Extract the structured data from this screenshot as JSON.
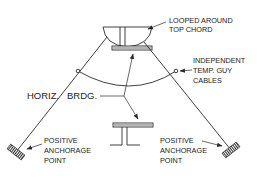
{
  "diagram": {
    "type": "structural-rigging-illustration",
    "colors": {
      "line": "#2a2a2a",
      "text": "#222222",
      "background": "#ffffff"
    },
    "labels": {
      "top_chord_l1": "LOOPED AROUND",
      "top_chord_l2": "TOP CHORD",
      "guy_l1": "INDEPENDENT",
      "guy_l2": "TEMP. GUY",
      "guy_l3": "CABLES",
      "horiz": "HORIZ.",
      "brdg": "BRDG.",
      "anchor_left_l1": "POSITIVE",
      "anchor_left_l2": "ANCHORAGE",
      "anchor_left_l3": "POINT",
      "anchor_right_l1": "POSITIVE",
      "anchor_right_l2": "ANCHORAGE",
      "anchor_right_l3": "POINT"
    },
    "components": [
      "top-chord-member",
      "bottom-chord-member",
      "left-guy-cable",
      "right-guy-cable",
      "horizontal-bridging-arc",
      "left-anchor",
      "right-anchor"
    ]
  }
}
